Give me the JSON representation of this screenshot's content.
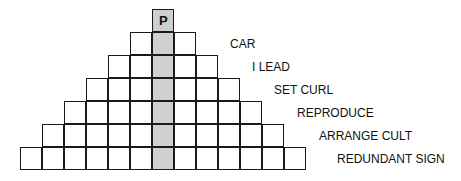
{
  "puzzle": {
    "type": "pyramid word puzzle",
    "shaded_column_color": "#cfcfcf",
    "rows": [
      {
        "cells": 1,
        "clue": "",
        "letters": [
          "P"
        ]
      },
      {
        "cells": 3,
        "clue": "CAR",
        "letters": [
          "",
          "",
          ""
        ]
      },
      {
        "cells": 5,
        "clue": "I LEAD",
        "letters": [
          "",
          "",
          "",
          "",
          ""
        ]
      },
      {
        "cells": 7,
        "clue": "SET CURL",
        "letters": [
          "",
          "",
          "",
          "",
          "",
          "",
          ""
        ]
      },
      {
        "cells": 9,
        "clue": "REPRODUCE",
        "letters": [
          "",
          "",
          "",
          "",
          "",
          "",
          "",
          "",
          ""
        ]
      },
      {
        "cells": 11,
        "clue": "ARRANGE CULT",
        "letters": [
          "",
          "",
          "",
          "",
          "",
          "",
          "",
          "",
          "",
          "",
          ""
        ]
      },
      {
        "cells": 13,
        "clue": "REDUNDANT SIGN",
        "letters": [
          "",
          "",
          "",
          "",
          "",
          "",
          "",
          "",
          "",
          "",
          "",
          "",
          ""
        ]
      }
    ]
  }
}
